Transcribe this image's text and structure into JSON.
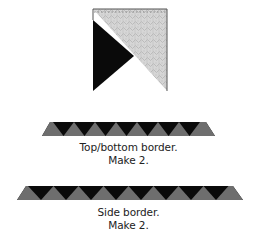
{
  "block": {
    "colors": {
      "dark": "#0a0a0a",
      "print": "#cfcfcf",
      "light": "#ffffff",
      "outline": "#555555"
    }
  },
  "top_bottom_border": {
    "caption_line1": "Top/bottom border.",
    "caption_line2": "Make 2.",
    "gray_triangles": 8,
    "colors": {
      "dark": "#0a0a0a",
      "gray": "#6e6e6e"
    }
  },
  "side_border": {
    "caption_line1": "Side border.",
    "caption_line2": "Make 2.",
    "gray_triangles": 9,
    "colors": {
      "dark": "#0a0a0a",
      "gray": "#6e6e6e"
    }
  }
}
